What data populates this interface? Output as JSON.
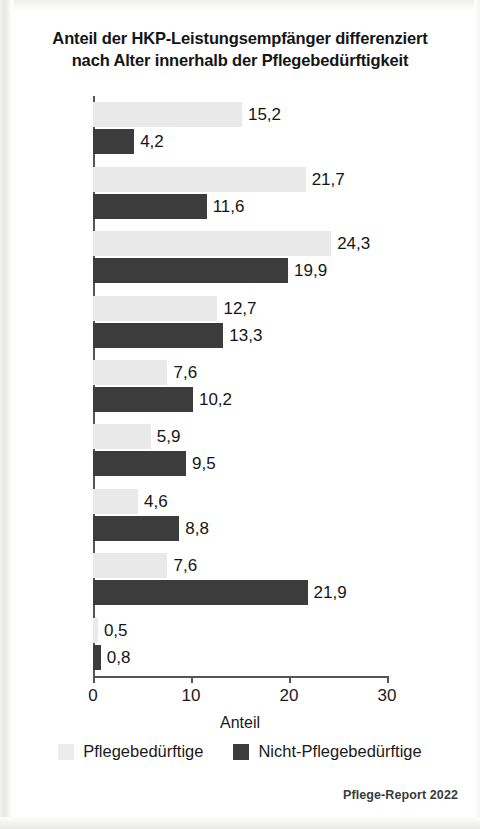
{
  "title": {
    "line1": "Anteil der HKP-Leistungsempfänger differenziert",
    "line2": "nach Alter innerhalb der Pflegebedürftigkeit"
  },
  "legend": {
    "items": [
      {
        "label": "Pflegebedürftige",
        "color": "#ececec",
        "swatch": "light-swatch"
      },
      {
        "label": "Nicht-Pflegebedürftige",
        "color": "#3c3c3c",
        "swatch": "dark-swatch"
      }
    ]
  },
  "source": "Pflege-Report 2022",
  "axis": {
    "x_label": "Anteil",
    "x_ticks": [
      "0",
      "10",
      "20",
      "30"
    ],
    "x_tick_values": [
      0,
      10,
      20,
      30
    ]
  },
  "values_display": {
    "90+": {
      "light": "15,2",
      "dark": "4,2"
    },
    "85-89": {
      "light": "21,7",
      "dark": "11,6"
    },
    "80-84": {
      "light": "24,3",
      "dark": "19,9"
    },
    "75-79": {
      "light": "12,7",
      "dark": "13,3"
    },
    "70-74": {
      "light": "7,6",
      "dark": "10,2"
    },
    "65-69": {
      "light": "5,9",
      "dark": "9,5"
    },
    "60-64": {
      "light": "4,6",
      "dark": "8,8"
    },
    "20-59": {
      "light": "7,6",
      "dark": "21,9"
    },
    "0-19": {
      "light": "0,5",
      "dark": "0,8"
    }
  },
  "chart_data": {
    "type": "bar",
    "orientation": "horizontal",
    "title": "Anteil der HKP-Leistungsempfänger differenziert nach Alter innerhalb der Pflegebedürftigkeit",
    "xlabel": "Anteil",
    "ylabel": "",
    "xlim": [
      0,
      30
    ],
    "grid": false,
    "legend_position": "bottom",
    "categories": [
      "90+",
      "85–89",
      "80–84",
      "75–79",
      "70–74",
      "65–69",
      "60–64",
      "20–59",
      "0–19"
    ],
    "series": [
      {
        "name": "Pflegebedürftige",
        "color": "#ececec",
        "values": [
          15.2,
          21.7,
          24.3,
          12.7,
          7.6,
          5.9,
          4.6,
          7.6,
          0.5
        ],
        "labels": [
          "15,2",
          "21,7",
          "24,3",
          "12,7",
          "7,6",
          "5,9",
          "4,6",
          "7,6",
          "0,5"
        ]
      },
      {
        "name": "Nicht-Pflegebedürftige",
        "color": "#3c3c3c",
        "values": [
          4.2,
          11.6,
          19.9,
          13.3,
          10.2,
          9.5,
          8.8,
          21.9,
          0.8
        ],
        "labels": [
          "4,2",
          "11,6",
          "19,9",
          "13,3",
          "10,2",
          "9,5",
          "8,8",
          "21,9",
          "0,8"
        ]
      }
    ],
    "annotation": "Pflege-Report 2022"
  }
}
